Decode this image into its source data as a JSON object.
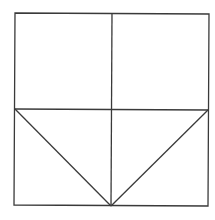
{
  "diagram": {
    "stroke_color": "#3a3a3a",
    "background": "#ffffff",
    "square": {
      "x1": 15,
      "y1": 13,
      "x2": 209,
      "y2": 206
    },
    "lines": [
      {
        "name": "vertical-midline",
        "x1": 112,
        "y1": 13,
        "x2": 111,
        "y2": 206
      },
      {
        "name": "horizontal-midline",
        "x1": 15,
        "y1": 109,
        "x2": 208,
        "y2": 110
      },
      {
        "name": "left-diagonal",
        "x1": 15,
        "y1": 109,
        "x2": 111,
        "y2": 206
      },
      {
        "name": "right-diagonal",
        "x1": 208,
        "y1": 110,
        "x2": 111,
        "y2": 206
      }
    ]
  }
}
